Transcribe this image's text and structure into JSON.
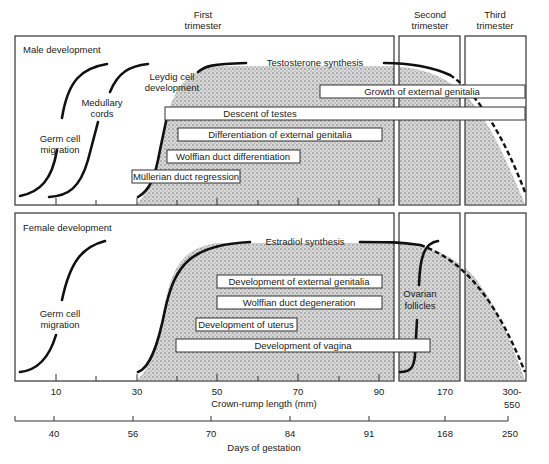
{
  "trimesters": {
    "first": [
      "First",
      "trimester"
    ],
    "second": [
      "Second",
      "trimester"
    ],
    "third": [
      "Third",
      "trimester"
    ]
  },
  "male": {
    "title": "Male development",
    "curve_labels": {
      "germ_cell": [
        "Germ cell",
        "migration"
      ],
      "medullary": [
        "Medullary",
        "cords"
      ],
      "leydig": [
        "Leydig cell",
        "development"
      ],
      "hormone": "Testosterone synthesis"
    },
    "bars": [
      {
        "label": "Growth of external genitalia",
        "x1": 320,
        "x2": 525,
        "y": 85
      },
      {
        "label": "Descent of testes",
        "x1": 165,
        "x2": 525,
        "y": 107
      },
      {
        "label": "Differentiation of external genitalia",
        "x1": 178,
        "x2": 382,
        "y": 128
      },
      {
        "label": "Wolffian duct differentiation",
        "x1": 167,
        "x2": 300,
        "y": 150
      },
      {
        "label": "Müllerian duct regression",
        "x1": 132,
        "x2": 240,
        "y": 170
      }
    ]
  },
  "female": {
    "title": "Female development",
    "curve_labels": {
      "germ_cell": [
        "Germ cell",
        "migration"
      ],
      "hormone": "Estradiol synthesis",
      "ovarian": [
        "Ovarian",
        "follicles"
      ]
    },
    "bars": [
      {
        "label": "Development of external genitalia",
        "x1": 217,
        "x2": 382,
        "y": 275
      },
      {
        "label": "Wolffian duct degeneration",
        "x1": 217,
        "x2": 382,
        "y": 296
      },
      {
        "label": "Development of uterus",
        "x1": 196,
        "x2": 297,
        "y": 318
      },
      {
        "label": "Development of vagina",
        "x1": 176,
        "x2": 430,
        "y": 339
      }
    ]
  },
  "axes": {
    "crown_rump": {
      "title": "Crown-rump length (mm)",
      "ticks": [
        {
          "label": "10",
          "x": 56
        },
        {
          "label": "30",
          "x": 137
        },
        {
          "label": "50",
          "x": 217
        },
        {
          "label": "70",
          "x": 298
        },
        {
          "label": "90",
          "x": 379
        },
        {
          "label": "170",
          "x": 445
        },
        {
          "label": "300-",
          "x": 512
        },
        {
          "label": "550",
          "x": 512
        }
      ]
    },
    "gestation": {
      "title": "Days of gestation",
      "ticks": [
        {
          "label": "40",
          "x": 54
        },
        {
          "label": "56",
          "x": 133
        },
        {
          "label": "70",
          "x": 211
        },
        {
          "label": "84",
          "x": 290
        },
        {
          "label": "91",
          "x": 369
        },
        {
          "label": "168",
          "x": 445
        },
        {
          "label": "250",
          "x": 510
        }
      ]
    }
  }
}
